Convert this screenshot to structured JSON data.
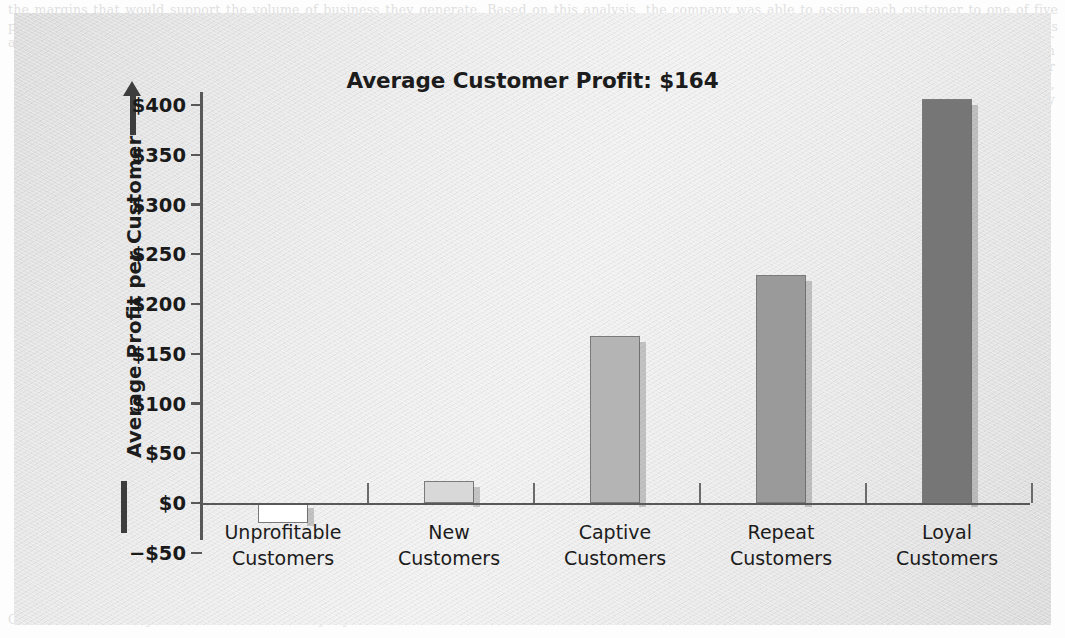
{
  "figure": {
    "title": "Average Customer Profit: $164",
    "y_axis_title": "Average Profit per Customer",
    "arrow_icon": "arrow-up-icon"
  },
  "page_bleed": {
    "top": "the margins that would support the volume of business they generate. Based on this analysis, the company was able to assign each customer to one of five profitability groups. Understanding the profitability profile of the customer base is a prerequisite for setting priorities, because it shows where the profits actually come from and which relationships are draining resources rather than adding to the bottom line.",
    "right": "profitability of every customer relationship, not merely the average. The resulting distribution is shown in the exhibit below, where each bar represents the average annual profit contributed by a customer in that segment. The unprofitable group actually destroys value, while the loyal group contributes more than twice the company average.",
    "left": "Chapter 7",
    "bottom": "Customer Profitability and the Economics of Loyalty"
  },
  "chart_data": {
    "type": "bar",
    "title": "Average Customer Profit: $164",
    "xlabel": "",
    "ylabel": "Average Profit per Customer",
    "categories": [
      "Unprofitable Customers",
      "New Customers",
      "Captive Customers",
      "Repeat Customers",
      "Loyal Customers"
    ],
    "category_lines": [
      [
        "Unprofitable",
        "Customers"
      ],
      [
        "New",
        "Customers"
      ],
      [
        "Captive",
        "Customers"
      ],
      [
        "Repeat",
        "Customers"
      ],
      [
        "Loyal",
        "Customers"
      ]
    ],
    "values": [
      -20,
      22,
      168,
      229,
      406
    ],
    "value_labels": [
      "-$20",
      "$22",
      "$168",
      "$229",
      "$406"
    ],
    "bar_colors": [
      "#ffffff",
      "#d8d8d8",
      "#b4b4b4",
      "#9a9a9a",
      "#767676"
    ],
    "bar_border_color": "#7a7a7a",
    "ylim": [
      -50,
      400
    ],
    "ytick_values": [
      400,
      350,
      300,
      250,
      200,
      150,
      100,
      50,
      0,
      -50
    ],
    "ytick_labels": [
      "$400",
      "$350",
      "$300",
      "$250",
      "$200",
      "$150",
      "$100",
      "$50",
      "$0",
      "−$50"
    ],
    "grid": false,
    "legend": false,
    "average_line_value": 164
  }
}
